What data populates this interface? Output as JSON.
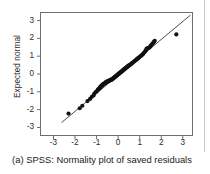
{
  "figure": {
    "caption": "(a) SPSS: Normality plot of saved residuals",
    "label": "(a)"
  },
  "colors": {
    "point": "#111111",
    "line": "#3a3a3a",
    "frame": "#6e6e6e",
    "text": "#1a1a1a",
    "background": "#ffffff",
    "page_rule": "#c9c9c9"
  },
  "chart_data": {
    "type": "scatter",
    "title": "",
    "subtitle": "",
    "xlabel": "",
    "ylabel": "Expected normal",
    "xlim": [
      -3.6,
      3.45
    ],
    "ylim": [
      -3.45,
      3.45
    ],
    "xticks": [
      -3,
      -2,
      -1,
      0,
      1,
      2,
      3
    ],
    "xticklabels": [
      "-3",
      "-2",
      "-1",
      "0",
      "1",
      "2",
      "3"
    ],
    "yticks": [
      -3,
      -2,
      -1,
      0,
      1,
      2,
      3
    ],
    "yticklabels": [
      "-3",
      "-2",
      "-1",
      "0",
      "1",
      "2",
      "3"
    ],
    "grid": false,
    "legend": null,
    "reference_line": {
      "label": "normal reference line",
      "x_start": -2.62,
      "y_start": -2.72,
      "x_end": 3.35,
      "y_end": 3.3,
      "slope": 1.0,
      "intercept": 0.0
    },
    "series": [
      {
        "name": "Saved residuals",
        "marker": "filled-circle",
        "points": [
          [
            -2.3,
            -2.22
          ],
          [
            -1.78,
            -1.92
          ],
          [
            -1.66,
            -1.78
          ],
          [
            -1.42,
            -1.52
          ],
          [
            -1.3,
            -1.4
          ],
          [
            -1.22,
            -1.28
          ],
          [
            -1.14,
            -1.2
          ],
          [
            -1.1,
            -1.1
          ],
          [
            -1.04,
            -1.02
          ],
          [
            -0.98,
            -0.96
          ],
          [
            -0.94,
            -0.88
          ],
          [
            -0.9,
            -0.84
          ],
          [
            -0.86,
            -0.8
          ],
          [
            -0.84,
            -0.74
          ],
          [
            -0.8,
            -0.7
          ],
          [
            -0.78,
            -0.66
          ],
          [
            -0.74,
            -0.64
          ],
          [
            -0.72,
            -0.6
          ],
          [
            -0.7,
            -0.58
          ],
          [
            -0.66,
            -0.56
          ],
          [
            -0.64,
            -0.54
          ],
          [
            -0.62,
            -0.52
          ],
          [
            -0.6,
            -0.5
          ],
          [
            -0.58,
            -0.48
          ],
          [
            -0.56,
            -0.46
          ],
          [
            -0.54,
            -0.44
          ],
          [
            -0.52,
            -0.43
          ],
          [
            -0.5,
            -0.42
          ],
          [
            -0.48,
            -0.41
          ],
          [
            -0.46,
            -0.4
          ],
          [
            -0.44,
            -0.39
          ],
          [
            -0.42,
            -0.38
          ],
          [
            -0.4,
            -0.37
          ],
          [
            -0.38,
            -0.35
          ],
          [
            -0.36,
            -0.34
          ],
          [
            -0.34,
            -0.33
          ],
          [
            -0.32,
            -0.32
          ],
          [
            -0.3,
            -0.31
          ],
          [
            -0.28,
            -0.3
          ],
          [
            -0.26,
            -0.28
          ],
          [
            -0.24,
            -0.26
          ],
          [
            -0.22,
            -0.24
          ],
          [
            -0.2,
            -0.22
          ],
          [
            -0.18,
            -0.2
          ],
          [
            -0.16,
            -0.18
          ],
          [
            -0.14,
            -0.16
          ],
          [
            -0.12,
            -0.14
          ],
          [
            -0.1,
            -0.12
          ],
          [
            -0.08,
            -0.1
          ],
          [
            -0.06,
            -0.08
          ],
          [
            -0.04,
            -0.06
          ],
          [
            -0.02,
            -0.04
          ],
          [
            0.0,
            -0.02
          ],
          [
            0.02,
            0.0
          ],
          [
            0.04,
            0.02
          ],
          [
            0.06,
            0.04
          ],
          [
            0.08,
            0.06
          ],
          [
            0.1,
            0.08
          ],
          [
            0.12,
            0.1
          ],
          [
            0.14,
            0.12
          ],
          [
            0.16,
            0.14
          ],
          [
            0.18,
            0.16
          ],
          [
            0.2,
            0.18
          ],
          [
            0.22,
            0.2
          ],
          [
            0.24,
            0.22
          ],
          [
            0.26,
            0.24
          ],
          [
            0.28,
            0.26
          ],
          [
            0.3,
            0.28
          ],
          [
            0.32,
            0.3
          ],
          [
            0.34,
            0.32
          ],
          [
            0.36,
            0.34
          ],
          [
            0.38,
            0.36
          ],
          [
            0.4,
            0.38
          ],
          [
            0.42,
            0.4
          ],
          [
            0.44,
            0.42
          ],
          [
            0.46,
            0.44
          ],
          [
            0.48,
            0.46
          ],
          [
            0.5,
            0.48
          ],
          [
            0.54,
            0.5
          ],
          [
            0.58,
            0.54
          ],
          [
            0.62,
            0.58
          ],
          [
            0.66,
            0.62
          ],
          [
            0.7,
            0.66
          ],
          [
            0.74,
            0.7
          ],
          [
            0.78,
            0.74
          ],
          [
            0.82,
            0.78
          ],
          [
            0.86,
            0.82
          ],
          [
            0.9,
            0.86
          ],
          [
            0.94,
            0.9
          ],
          [
            0.98,
            0.94
          ],
          [
            1.02,
            0.98
          ],
          [
            1.06,
            1.02
          ],
          [
            1.1,
            1.06
          ],
          [
            1.14,
            1.1
          ],
          [
            1.18,
            1.16
          ],
          [
            1.22,
            1.22
          ],
          [
            1.26,
            1.28
          ],
          [
            1.3,
            1.34
          ],
          [
            1.32,
            1.42
          ],
          [
            1.36,
            1.44
          ],
          [
            1.42,
            1.46
          ],
          [
            1.46,
            1.5
          ],
          [
            1.5,
            1.56
          ],
          [
            1.54,
            1.62
          ],
          [
            1.58,
            1.68
          ],
          [
            1.62,
            1.74
          ],
          [
            1.66,
            1.8
          ],
          [
            1.7,
            1.86
          ],
          [
            2.7,
            2.22
          ]
        ]
      }
    ],
    "annotations": [
      {
        "name": "upper-outlier",
        "x": 2.7,
        "y": 2.22,
        "note": "point falls below the reference line"
      },
      {
        "name": "lower-outlier",
        "x": -2.3,
        "y": -2.22,
        "note": "point falls above the reference line"
      }
    ]
  }
}
